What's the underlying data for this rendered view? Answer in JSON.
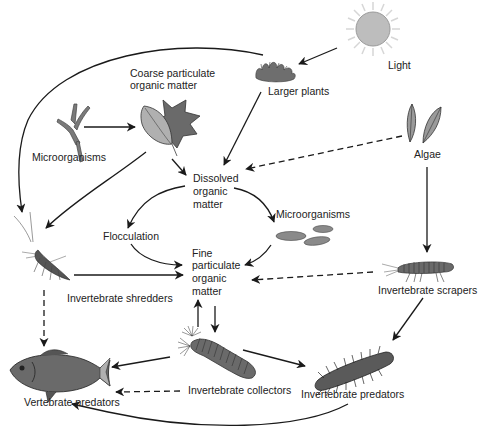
{
  "diagram": {
    "colors": {
      "line": "#1a1a1a",
      "fill_gray": "#8c8c8c",
      "fill_dark": "#5a5a5a",
      "sun_fill": "#bdbdbd",
      "sun_rays": "#d0d0d0",
      "background": "#ffffff"
    },
    "nodes": {
      "light": {
        "label": "Light"
      },
      "larger_plants": {
        "label": "Larger plants"
      },
      "coarse_pom": {
        "label_line1": "Coarse particulate",
        "label_line2": "organic matter"
      },
      "microorganisms_left": {
        "label": "Microorganisms"
      },
      "algae": {
        "label": "Algae"
      },
      "dom": {
        "label_line1": "Dissolved",
        "label_line2": "organic",
        "label_line3": "matter"
      },
      "microorganisms_right": {
        "label": "Microorganisms"
      },
      "flocculation": {
        "label": "Flocculation"
      },
      "fpom": {
        "label_line1": "Fine",
        "label_line2": "particulate",
        "label_line3": "organic",
        "label_line4": "matter"
      },
      "shredders": {
        "label": "Invertebrate shredders"
      },
      "scrapers": {
        "label": "Invertebrate scrapers"
      },
      "collectors": {
        "label": "Invertebrate collectors"
      },
      "inv_predators": {
        "label": "Invertebrate predators"
      },
      "vert_predators": {
        "label": "Vertebrate predators"
      }
    },
    "edges": [
      {
        "from": "light",
        "to": "larger_plants",
        "style": "solid"
      },
      {
        "from": "light",
        "to": "algae",
        "style": "solid"
      },
      {
        "from": "larger_plants",
        "to": "shredders",
        "style": "solid"
      },
      {
        "from": "larger_plants",
        "to": "dom",
        "style": "solid"
      },
      {
        "from": "microorganisms_left",
        "to": "coarse_pom",
        "style": "solid"
      },
      {
        "from": "coarse_pom",
        "to": "dom",
        "style": "solid"
      },
      {
        "from": "coarse_pom",
        "to": "shredders",
        "style": "solid"
      },
      {
        "from": "algae",
        "to": "dom",
        "style": "dashed"
      },
      {
        "from": "algae",
        "to": "scrapers",
        "style": "solid"
      },
      {
        "from": "dom",
        "to": "flocculation",
        "style": "solid"
      },
      {
        "from": "dom",
        "to": "microorganisms_right",
        "style": "solid"
      },
      {
        "from": "flocculation",
        "to": "fpom",
        "style": "solid"
      },
      {
        "from": "microorganisms_right",
        "to": "fpom",
        "style": "solid"
      },
      {
        "from": "shredders",
        "to": "fpom",
        "style": "solid"
      },
      {
        "from": "scrapers",
        "to": "fpom",
        "style": "dashed"
      },
      {
        "from": "collectors",
        "to": "fpom",
        "style": "solid"
      },
      {
        "from": "fpom",
        "to": "collectors",
        "style": "solid"
      },
      {
        "from": "shredders",
        "to": "vert_predators",
        "style": "dashed"
      },
      {
        "from": "collectors",
        "to": "vert_predators",
        "style": "solid"
      },
      {
        "from": "collectors",
        "to": "vert_predators",
        "style": "dashed"
      },
      {
        "from": "collectors",
        "to": "inv_predators",
        "style": "solid"
      },
      {
        "from": "scrapers",
        "to": "inv_predators",
        "style": "solid"
      },
      {
        "from": "inv_predators",
        "to": "vert_predators",
        "style": "solid"
      }
    ]
  }
}
